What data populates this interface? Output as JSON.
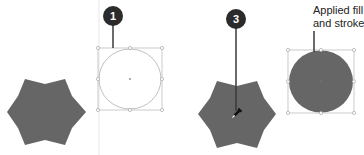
{
  "figure": {
    "colors": {
      "shape_fill": "#666666",
      "selection_stroke": "#b5b5b5",
      "badge_fill": "#2b2b2b",
      "leader_line": "#3a3a3a",
      "guide_line": "#e6e6e6"
    }
  },
  "callouts": {
    "step1": {
      "number": "1"
    },
    "step3": {
      "number": "3"
    },
    "result_label_line1": "Applied fill",
    "result_label_line2": "and stroke"
  },
  "shapes": {
    "left_star": {
      "type": "six-point star",
      "fill": "filled gray"
    },
    "left_circle": {
      "type": "circle",
      "fill": "none",
      "selected": true
    },
    "right_star": {
      "type": "six-point star",
      "fill": "filled gray",
      "cursor": "eyedropper"
    },
    "right_circle": {
      "type": "circle",
      "fill": "filled gray",
      "selected": true
    }
  }
}
